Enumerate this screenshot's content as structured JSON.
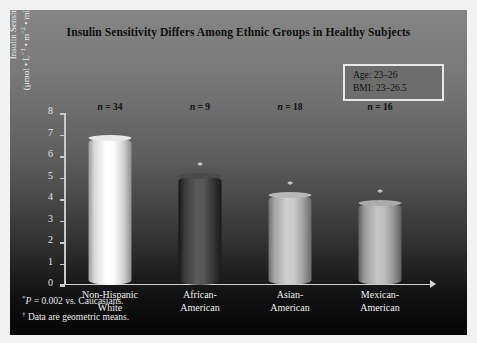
{
  "chart_data": {
    "type": "bar",
    "title": "Insulin Sensitivity Differs Among Ethnic Groups in Healthy Subjects",
    "categories": [
      "Non-Hispanic White",
      "African-American",
      "Asian-American",
      "Mexican-American"
    ],
    "values": [
      6.85,
      5.05,
      4.2,
      3.8
    ],
    "xlabel": "",
    "ylabel": "Insulin Sensitivity Index (μmol • L−1 • m−2 • min−1 • pmol−1 • L−1)†",
    "ylim": [
      0,
      8
    ],
    "yticks": [
      0,
      1,
      2,
      3,
      4,
      5,
      6,
      7,
      8
    ],
    "grid": false,
    "legend_position": "none",
    "point_labels": [
      "n = 34",
      "n = 9",
      "n = 18",
      "n = 16"
    ],
    "significance_markers": [
      false,
      true,
      true,
      true
    ],
    "bar_colors": [
      "#ffffff",
      "#5a5a5a",
      "#cfcfcf",
      "#c4c4c4"
    ],
    "annotations": [
      "Age: 23–26",
      "BMI: 23–26.5"
    ],
    "footnotes": [
      "P = 0.002 vs. Caucasians.",
      "Data are geometric means."
    ]
  },
  "chart": {
    "title": "Insulin Sensitivity Differs Among Ethnic Groups in Healthy Subjects",
    "y_axis": {
      "title_line1": "Insulin Sensitivity Index",
      "ticks": [
        "8",
        "7",
        "6",
        "5",
        "4",
        "3",
        "2",
        "1",
        "0"
      ]
    },
    "annotation_box": {
      "age": "Age: 23–26",
      "bmi": "BMI: 23–26.5"
    },
    "bars": [
      {
        "n_label": "n = 34",
        "category_line1": "Non-Hispanic",
        "category_line2": "White",
        "star": ""
      },
      {
        "n_label": "n = 9",
        "category_line1": "African-",
        "category_line2": "American",
        "star": "*"
      },
      {
        "n_label": "n = 18",
        "category_line1": "Asian-",
        "category_line2": "American",
        "star": "*"
      },
      {
        "n_label": "n = 16",
        "category_line1": "Mexican-",
        "category_line2": "American",
        "star": "*"
      }
    ],
    "footnotes": {
      "mark1": "*",
      "text1": "P = 0.002 vs. Caucasians.",
      "mark2": "†",
      "text2": "Data are geometric means."
    }
  }
}
